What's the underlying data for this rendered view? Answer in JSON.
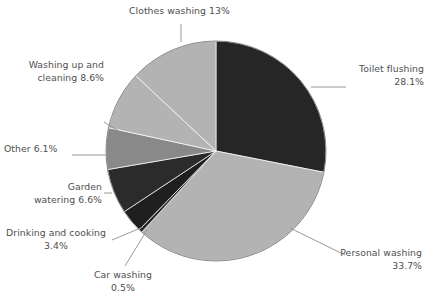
{
  "chart_data": {
    "type": "pie",
    "title": "",
    "subtitle": "",
    "xlabel": "",
    "ylabel": "",
    "legend_position": "none",
    "grid": false,
    "labels_inline": true,
    "unit": "%",
    "total": 100,
    "categories": [
      "Toilet flushing",
      "Personal washing",
      "Car washing",
      "Drinking and cooking",
      "Garden watering",
      "Other",
      "Washing up and cleaning",
      "Clothes washing"
    ],
    "values": [
      28.1,
      33.7,
      0.5,
      3.4,
      6.6,
      6.1,
      8.6,
      13
    ],
    "slices": [
      {
        "name": "Toilet flushing",
        "value": 28.1,
        "value_text": "28.1%",
        "label_text": "Toilet flushing\n28.1%",
        "color": "#262626",
        "start_angle": 0,
        "end_angle": 101.16
      },
      {
        "name": "Personal washing",
        "value": 33.7,
        "value_text": "33.7%",
        "label_text": "Personal washing\n33.7%",
        "color": "#b3b3b3",
        "start_angle": 101.16,
        "end_angle": 222.48
      },
      {
        "name": "Car washing",
        "value": 0.5,
        "value_text": "0.5%",
        "label_text": "Car washing\n0.5%",
        "color": "#262626",
        "start_angle": 222.48,
        "end_angle": 224.28
      },
      {
        "name": "Drinking and cooking",
        "value": 3.4,
        "value_text": "3.4%",
        "label_text": "Drinking and cooking\n3.4%",
        "color": "#1f1f1f",
        "start_angle": 224.28,
        "end_angle": 236.52
      },
      {
        "name": "Garden watering",
        "value": 6.6,
        "value_text": "6.6%",
        "label_text": "Garden\nwatering 6.6%",
        "color": "#2b2b2b",
        "start_angle": 236.52,
        "end_angle": 260.28
      },
      {
        "name": "Other",
        "value": 6.1,
        "value_text": "6.1%",
        "label_text": "Other 6.1%",
        "color": "#898989",
        "start_angle": 260.28,
        "end_angle": 282.24
      },
      {
        "name": "Washing up and cleaning",
        "value": 8.6,
        "value_text": "8.6%",
        "label_text": "Washing up and\ncleaning 8.6%",
        "color": "#b3b3b3",
        "start_angle": 282.24,
        "end_angle": 313.2
      },
      {
        "name": "Clothes washing",
        "value": 13,
        "value_text": "13%",
        "label_text": "Clothes washing 13%",
        "color": "#b3b3b3",
        "start_angle": 313.2,
        "end_angle": 360
      }
    ],
    "geometry": {
      "center_x": 216,
      "center_y": 151,
      "radius": 110
    },
    "colors": {
      "dark": "#262626",
      "mid": "#898989",
      "light": "#b3b3b3",
      "leader_line": "#8f8f8f",
      "text": "#4f4f4f",
      "background": "#ffffff"
    },
    "leader_lines": [
      {
        "name": "toilet-flushing",
        "x1": 311,
        "y1": 87,
        "x2": 346,
        "y2": 87
      },
      {
        "name": "personal-washing",
        "x1": 290,
        "y1": 228,
        "x2": 345,
        "y2": 255
      },
      {
        "name": "car-washing",
        "x1": 147,
        "y1": 230,
        "x2": 125,
        "y2": 266
      },
      {
        "name": "drinking-cooking",
        "x1": 143,
        "y1": 227,
        "x2": 112,
        "y2": 240
      },
      {
        "name": "garden-watering",
        "x1": 112,
        "y1": 193,
        "x2": 104,
        "y2": 193
      },
      {
        "name": "other",
        "x1": 107,
        "y1": 155,
        "x2": 72,
        "y2": 155
      },
      {
        "name": "washing-up-cleaning",
        "x1": 120,
        "y1": 132,
        "x2": 104,
        "y2": 122
      },
      {
        "name": "clothes-washing",
        "x1": 181,
        "y1": 42,
        "x2": 181,
        "y2": 24
      }
    ]
  }
}
